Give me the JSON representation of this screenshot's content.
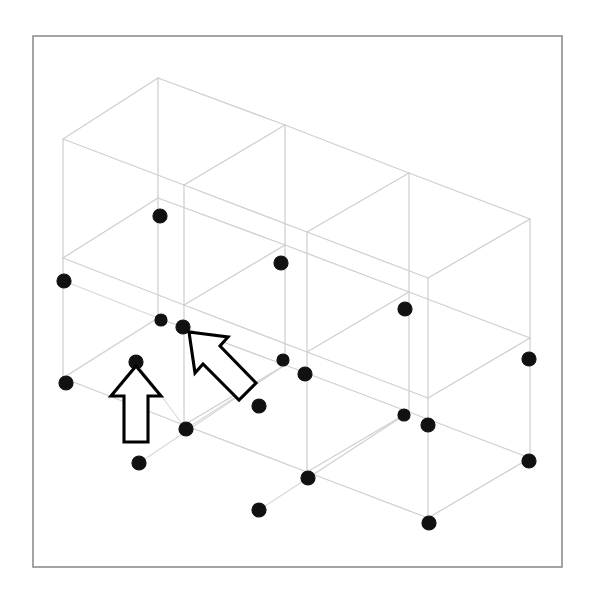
{
  "figure": {
    "title": "Isometric wireframe of a multi-storey building frame with marked nodes",
    "caption": "",
    "background_color": "#ffffff",
    "border_color": "#8e8e90",
    "wire_color": "#cfcfcf",
    "node_color": "#111111",
    "arrow_stroke_color": "#000000",
    "arrow_fill_color": "#ffffff",
    "border": {
      "x": 33,
      "y": 36,
      "width": 529,
      "height": 531
    }
  },
  "chart_data": {
    "type": "scatter",
    "title": "Isometric wireframe of a multi-storey building frame with marked nodes",
    "subtitle": "",
    "xlabel": "",
    "ylabel": "",
    "xlim": [
      0,
      603
    ],
    "ylim": [
      0,
      602
    ],
    "grid": false,
    "legend": "none",
    "annotations": [
      {
        "name": "vertical-arrow",
        "label": "",
        "points_to_x": 136,
        "points_to_y": 366,
        "direction": "up"
      },
      {
        "name": "diagonal-arrow",
        "label": "",
        "points_to_x": 187,
        "points_to_y": 331,
        "direction": "up-left"
      }
    ],
    "wire_nodes": [
      {
        "id": "A3",
        "x": 158,
        "y": 78
      },
      {
        "id": "B3",
        "x": 285,
        "y": 125
      },
      {
        "id": "C3",
        "x": 409,
        "y": 173
      },
      {
        "id": "D3",
        "x": 530,
        "y": 219
      },
      {
        "id": "A3f",
        "x": 63,
        "y": 139
      },
      {
        "id": "B3f",
        "x": 184,
        "y": 185
      },
      {
        "id": "C3f",
        "x": 307,
        "y": 232
      },
      {
        "id": "D3f",
        "x": 428,
        "y": 278
      },
      {
        "id": "A2",
        "x": 158,
        "y": 198
      },
      {
        "id": "B2",
        "x": 285,
        "y": 245
      },
      {
        "id": "C2",
        "x": 409,
        "y": 292
      },
      {
        "id": "D2",
        "x": 530,
        "y": 338
      },
      {
        "id": "A2f",
        "x": 63,
        "y": 258
      },
      {
        "id": "B2f",
        "x": 184,
        "y": 305
      },
      {
        "id": "C2f",
        "x": 307,
        "y": 352
      },
      {
        "id": "D2f",
        "x": 428,
        "y": 398
      },
      {
        "id": "A1",
        "x": 158,
        "y": 318
      },
      {
        "id": "B1",
        "x": 285,
        "y": 365
      },
      {
        "id": "C1",
        "x": 409,
        "y": 412
      },
      {
        "id": "D1",
        "x": 530,
        "y": 458
      },
      {
        "id": "A1f",
        "x": 63,
        "y": 378
      },
      {
        "id": "B1f",
        "x": 184,
        "y": 425
      },
      {
        "id": "C1f",
        "x": 307,
        "y": 472
      },
      {
        "id": "D1f",
        "x": 428,
        "y": 518
      }
    ],
    "marker_dots": [
      {
        "id": "m01",
        "x": 160,
        "y": 216,
        "r": 7
      },
      {
        "id": "m02",
        "x": 281,
        "y": 263,
        "r": 7
      },
      {
        "id": "m03",
        "x": 64,
        "y": 281,
        "r": 7
      },
      {
        "id": "m04",
        "x": 161,
        "y": 320,
        "r": 6
      },
      {
        "id": "m05",
        "x": 183,
        "y": 327,
        "r": 7
      },
      {
        "id": "m06",
        "x": 136,
        "y": 362,
        "r": 7
      },
      {
        "id": "m07",
        "x": 66,
        "y": 383,
        "r": 7
      },
      {
        "id": "m08",
        "x": 283,
        "y": 360,
        "r": 6
      },
      {
        "id": "m09",
        "x": 305,
        "y": 374,
        "r": 7
      },
      {
        "id": "m10",
        "x": 405,
        "y": 309,
        "r": 7
      },
      {
        "id": "m11",
        "x": 529,
        "y": 359,
        "r": 7
      },
      {
        "id": "m12",
        "x": 259,
        "y": 406,
        "r": 7
      },
      {
        "id": "m13",
        "x": 186,
        "y": 429,
        "r": 7
      },
      {
        "id": "m14",
        "x": 404,
        "y": 415,
        "r": 6
      },
      {
        "id": "m15",
        "x": 428,
        "y": 425,
        "r": 7
      },
      {
        "id": "m16",
        "x": 139,
        "y": 463,
        "r": 7
      },
      {
        "id": "m17",
        "x": 308,
        "y": 478,
        "r": 7
      },
      {
        "id": "m18",
        "x": 529,
        "y": 461,
        "r": 7
      },
      {
        "id": "m19",
        "x": 259,
        "y": 510,
        "r": 7
      },
      {
        "id": "m20",
        "x": 429,
        "y": 523,
        "r": 7
      }
    ]
  }
}
